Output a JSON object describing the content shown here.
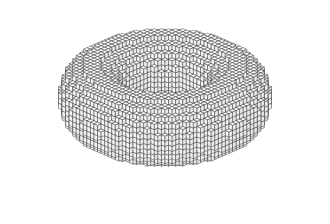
{
  "figure": {
    "background_color": "#ffffff",
    "edge_color": "#2a2a2a",
    "face_colors": {
      "top": "#ffffff",
      "left": "#f4f4f4",
      "right": "#ececec"
    }
  },
  "voxel_model": {
    "shape": "torus",
    "major_radius": 14.5,
    "minor_radius": 6.2,
    "grid": 42,
    "layers": 13
  },
  "projection": {
    "origin_x": 165,
    "origin_y": 40,
    "cell_x": 3.55,
    "cell_y": 1.55,
    "cell_z": 5.1
  }
}
